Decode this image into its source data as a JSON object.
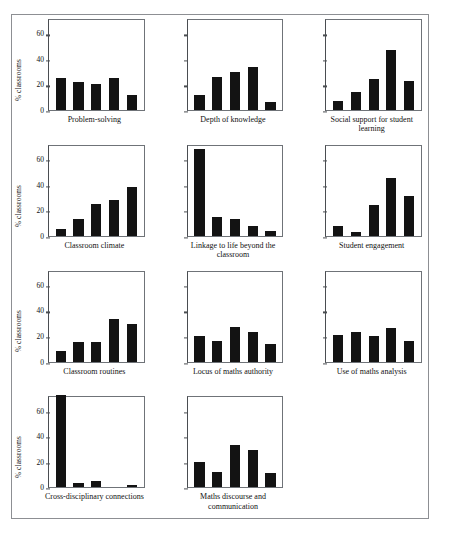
{
  "figure": {
    "ylabel": "% classrooms",
    "y_ticks": [
      "0",
      "20",
      "40",
      "60"
    ]
  },
  "chart_data": {
    "type": "bar",
    "title": "",
    "xlabel": "",
    "ylabel": "% classrooms",
    "ylim": [
      0,
      72
    ],
    "yticks": [
      0,
      20,
      40,
      60
    ],
    "grid": false,
    "legend": "none",
    "layout": "small multiples, 3 columns x 4 rows, 11 panels",
    "categories": [
      "1",
      "2",
      "3",
      "4",
      "5"
    ],
    "panels": [
      {
        "title": "Problem-solving",
        "values": [
          25,
          22,
          20,
          25,
          12
        ]
      },
      {
        "title": "Depth of knowledge",
        "values": [
          12,
          26,
          30,
          34,
          6
        ]
      },
      {
        "title": "Social support for student learning",
        "values": [
          7,
          14,
          24,
          47,
          23
        ]
      },
      {
        "title": "Classroom climate",
        "values": [
          5,
          13,
          25,
          28,
          38
        ]
      },
      {
        "title": "Linkage to life beyond the classroom",
        "values": [
          68,
          15,
          13,
          8,
          4
        ]
      },
      {
        "title": "Student engagement",
        "values": [
          8,
          3,
          24,
          45,
          31
        ]
      },
      {
        "title": "Classroom routines",
        "values": [
          8,
          15,
          15,
          33,
          29
        ]
      },
      {
        "title": "Locus of maths authority",
        "values": [
          20,
          16,
          27,
          23,
          14
        ]
      },
      {
        "title": "Use of maths analysis",
        "values": [
          21,
          23,
          20,
          26,
          16
        ]
      },
      {
        "title": "Cross-disciplinary connections",
        "values": [
          72,
          3,
          5,
          0,
          2
        ]
      },
      {
        "title": "Maths discourse and communication",
        "values": [
          20,
          12,
          33,
          29,
          11
        ]
      }
    ]
  },
  "colors": {
    "bar": "#131313",
    "axis": "#4a4d51",
    "frame": "#8d8f93",
    "background": "#ffffff"
  }
}
